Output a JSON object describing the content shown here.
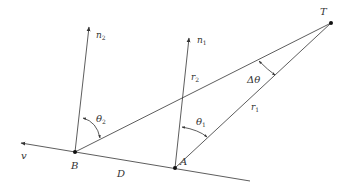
{
  "diagram": {
    "title": "",
    "colors": {
      "line": "#333333",
      "label": "#333333",
      "background": "#ffffff"
    },
    "points": {
      "B": {
        "label": "B",
        "x": 75,
        "y": 152
      },
      "A": {
        "label": "A",
        "x": 175,
        "y": 168
      },
      "T": {
        "label": "T",
        "x": 331,
        "y": 23
      }
    },
    "vectors": {
      "n2": {
        "label": "n",
        "sub": "2"
      },
      "n1": {
        "label": "n",
        "sub": "1"
      },
      "v": {
        "label": "v"
      }
    },
    "segments": {
      "r1": {
        "label": "r",
        "sub": "1"
      },
      "r2": {
        "label": "r",
        "sub": "2"
      },
      "D": {
        "label": "D"
      }
    },
    "angles": {
      "theta2": {
        "label": "θ",
        "sub": "2"
      },
      "theta1": {
        "label": "θ",
        "sub": "1"
      },
      "delta_theta": {
        "label": "Δθ"
      }
    }
  }
}
